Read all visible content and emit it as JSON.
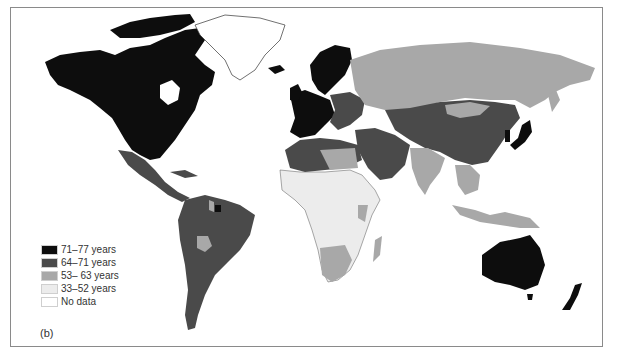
{
  "figure": {
    "panel_label": "(b)",
    "type": "choropleth world map"
  },
  "colors": {
    "c71_77": "#0d0d0d",
    "c64_71": "#4a4a4a",
    "c53_63": "#a8a8a8",
    "c33_52": "#ececec",
    "no_data": "#ffffff",
    "frame": "#8a8a8a"
  },
  "legend": {
    "items": [
      {
        "label": "71–77 years",
        "color": "#0d0d0d"
      },
      {
        "label": "64–71 years",
        "color": "#4a4a4a"
      },
      {
        "label": "53– 63 years",
        "color": "#a8a8a8"
      },
      {
        "label": "33–52 years",
        "color": "#ececec"
      },
      {
        "label": "No data",
        "color": "#ffffff"
      }
    ]
  },
  "regions": [
    {
      "name": "North America (USA, Canada)",
      "class": "71–77 years"
    },
    {
      "name": "Greenland",
      "class": "No data"
    },
    {
      "name": "Mexico / Central America",
      "class": "64–71 years"
    },
    {
      "name": "South America",
      "class": "64–71 years"
    },
    {
      "name": "Bolivia",
      "class": "53– 63 years"
    },
    {
      "name": "Western Europe / Scandinavia",
      "class": "71–77 years"
    },
    {
      "name": "Eastern Europe",
      "class": "64–71 years"
    },
    {
      "name": "Russia",
      "class": "53– 63 years"
    },
    {
      "name": "China / Central Asia",
      "class": "64–71 years"
    },
    {
      "name": "India",
      "class": "53– 63 years"
    },
    {
      "name": "Japan",
      "class": "71–77 years"
    },
    {
      "name": "North Africa",
      "class": "64–71 years"
    },
    {
      "name": "Sub-Saharan Africa",
      "class": "33–52 years"
    },
    {
      "name": "Southern Africa",
      "class": "53– 63 years"
    },
    {
      "name": "Middle East",
      "class": "64–71 years"
    },
    {
      "name": "Southeast Asia",
      "class": "53– 63 years"
    },
    {
      "name": "Australia",
      "class": "71–77 years"
    },
    {
      "name": "New Zealand",
      "class": "71–77 years"
    }
  ]
}
